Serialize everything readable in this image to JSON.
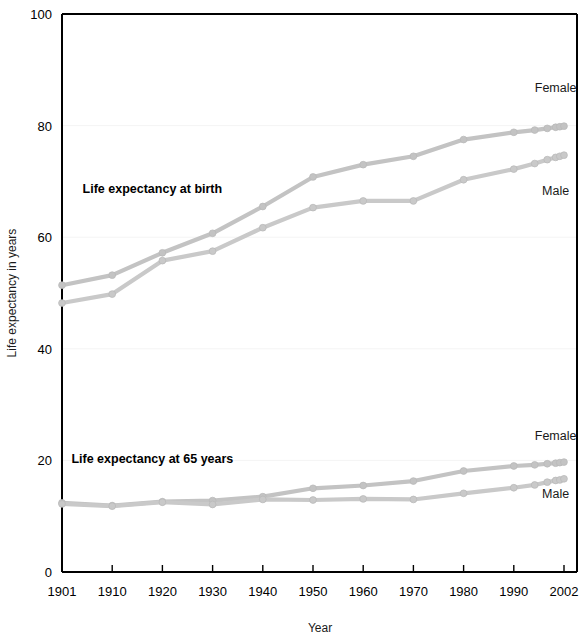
{
  "chart_data": {
    "type": "line",
    "title": "",
    "xlabel": "Year",
    "ylabel": "Life expectancy in years",
    "ylim": [
      0,
      100
    ],
    "yticks": [
      0,
      20,
      40,
      60,
      80,
      100
    ],
    "xticks": [
      1901,
      1910,
      1920,
      1930,
      1940,
      1950,
      1960,
      1970,
      1980,
      1990,
      2002
    ],
    "xlim": [
      1901,
      2002
    ],
    "grid": "faint-horizontal",
    "legend": "inline-end-labels",
    "annotations": [
      {
        "id": "birth-group",
        "text": "Life expectancy at birth",
        "x": 1918,
        "y": 68
      },
      {
        "id": "age65-group",
        "text": "Life expectancy at 65 years",
        "x": 1918,
        "y": 19.5
      }
    ],
    "series": [
      {
        "name": "Female",
        "group": "Life expectancy at birth",
        "label": "Female",
        "color": "#c3c3c3",
        "x": [
          1901,
          1910,
          1920,
          1930,
          1940,
          1950,
          1960,
          1970,
          1980,
          1990,
          1995,
          1998,
          2000,
          2001,
          2002
        ],
        "values": [
          51.4,
          53.2,
          57.2,
          60.7,
          65.5,
          70.8,
          73.0,
          74.5,
          77.5,
          78.8,
          79.2,
          79.5,
          79.7,
          79.8,
          79.9
        ]
      },
      {
        "name": "Male",
        "group": "Life expectancy at birth",
        "label": "Male",
        "color": "#c9c9c9",
        "x": [
          1901,
          1910,
          1920,
          1930,
          1940,
          1950,
          1960,
          1970,
          1980,
          1990,
          1995,
          1998,
          2000,
          2001,
          2002
        ],
        "values": [
          48.2,
          49.8,
          55.8,
          57.5,
          61.7,
          65.3,
          66.5,
          66.5,
          70.3,
          72.2,
          73.2,
          73.9,
          74.3,
          74.5,
          74.7
        ]
      },
      {
        "name": "Female",
        "group": "Life expectancy at 65 years",
        "label": "Female",
        "color": "#c3c3c3",
        "x": [
          1901,
          1910,
          1920,
          1930,
          1940,
          1950,
          1960,
          1970,
          1980,
          1990,
          1995,
          1998,
          2000,
          2001,
          2002
        ],
        "values": [
          12.4,
          11.9,
          12.6,
          12.8,
          13.5,
          15.0,
          15.5,
          16.3,
          18.1,
          19.0,
          19.2,
          19.4,
          19.5,
          19.6,
          19.7
        ]
      },
      {
        "name": "Male",
        "group": "Life expectancy at 65 years",
        "label": "Male",
        "color": "#c9c9c9",
        "x": [
          1901,
          1910,
          1920,
          1930,
          1940,
          1950,
          1960,
          1970,
          1980,
          1990,
          1995,
          1998,
          2000,
          2001,
          2002
        ],
        "values": [
          12.2,
          11.8,
          12.5,
          12.1,
          13.0,
          12.9,
          13.1,
          13.0,
          14.1,
          15.1,
          15.6,
          16.1,
          16.4,
          16.5,
          16.7
        ]
      }
    ]
  },
  "axis": {
    "y_title": "Life expectancy in years",
    "x_title": "Year",
    "y_tick_labels": [
      "0",
      "20",
      "40",
      "60",
      "80",
      "100"
    ],
    "x_tick_labels": [
      "1901",
      "1910",
      "1920",
      "1930",
      "1940",
      "1950",
      "1960",
      "1970",
      "1980",
      "1990",
      "2002"
    ]
  },
  "labels": {
    "birth_group": "Life expectancy at birth",
    "age65_group": "Life expectancy at 65 years",
    "birth_female": "Female",
    "birth_male": "Male",
    "age65_female": "Female",
    "age65_male": "Male"
  },
  "colors": {
    "female_line": "#c3c3c3",
    "male_line": "#c9c9c9",
    "axis": "#000000",
    "grid": "#f4f4f4",
    "text": "#000000",
    "background": "#ffffff"
  }
}
